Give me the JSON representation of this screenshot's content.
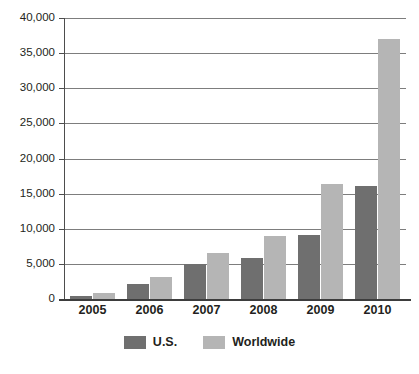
{
  "chart_data": {
    "type": "bar",
    "title": "",
    "xlabel": "",
    "ylabel": "",
    "categories": [
      "2005",
      "2006",
      "2007",
      "2008",
      "2009",
      "2010"
    ],
    "series": [
      {
        "name": "U.S.",
        "values": [
          400,
          2100,
          5000,
          5800,
          9100,
          16100
        ]
      },
      {
        "name": "Worldwide",
        "values": [
          900,
          3100,
          6500,
          9000,
          16400,
          37000
        ]
      }
    ],
    "ylim": [
      0,
      40000
    ],
    "ytick_values": [
      0,
      5000,
      10000,
      15000,
      20000,
      25000,
      30000,
      35000,
      40000
    ],
    "ytick_labels": [
      "0",
      "5,000",
      "10,000",
      "15,000",
      "20,000",
      "25,000",
      "30,000",
      "35,000",
      "40,000"
    ],
    "grid": true,
    "legend_position": "bottom-center",
    "colors": {
      "us": "#6f6f6f",
      "worldwide": "#b5b5b5",
      "gridline": "#7d7d7d",
      "axis": "#3d3d3d",
      "text": "#231f20",
      "background": "#ffffff"
    }
  },
  "legend": {
    "items": [
      {
        "label": "U.S.",
        "key": "us"
      },
      {
        "label": "Worldwide",
        "key": "ww"
      }
    ]
  }
}
